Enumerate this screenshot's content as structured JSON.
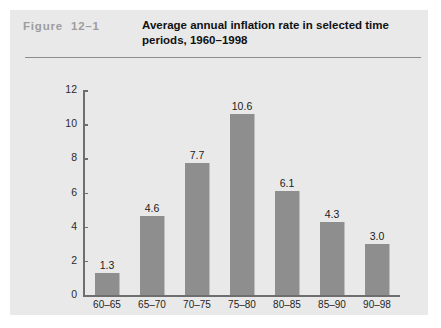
{
  "figure": {
    "number_label": "Figure  12–1",
    "title": "Average annual inflation rate in selected time periods, 1960–1998"
  },
  "colors": {
    "panel_background": "#e9e9e9",
    "bar_fill": "#8e8e8e",
    "axis": "#6e6e6e",
    "figure_number_text": "#9d9d9d",
    "title_text": "#111111"
  },
  "chart_data": {
    "type": "bar",
    "title": "Average annual inflation rate in selected time periods, 1960–1998",
    "xlabel": "",
    "ylabel": "",
    "categories": [
      "60–65",
      "65–70",
      "70–75",
      "75–80",
      "80–85",
      "85–90",
      "90–98"
    ],
    "values": [
      1.3,
      4.6,
      7.7,
      10.6,
      6.1,
      4.3,
      3.0
    ],
    "value_labels": [
      "1.3",
      "4.6",
      "7.7",
      "10.6",
      "6.1",
      "4.3",
      "3.0"
    ],
    "ylim": [
      0,
      12
    ],
    "yticks": [
      0,
      2,
      4,
      6,
      8,
      10,
      12
    ],
    "ytick_labels": [
      "0",
      "2",
      "4",
      "6",
      "8",
      "10",
      "12"
    ],
    "grid": false,
    "legend": null
  }
}
